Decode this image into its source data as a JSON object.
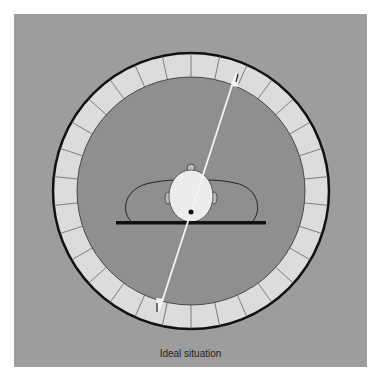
{
  "diagram": {
    "caption": "Ideal situation",
    "ring": {
      "segments": 30,
      "center": [
        191,
        191
      ],
      "outer_radius": 138,
      "inner_radius": 114
    },
    "arrow": {
      "from": [
        159,
        311
      ],
      "to": [
        236,
        73
      ]
    },
    "colors": {
      "panel": "#9d9d9d",
      "inner_disk": "#8f8f8f",
      "ring_fill": "#dcdcdc",
      "outline": "#111111",
      "head_fill": "#ececec",
      "arrow": "#f4f4f4"
    }
  }
}
